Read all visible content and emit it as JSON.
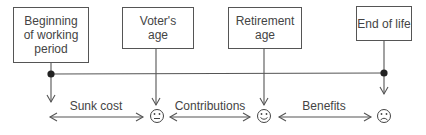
{
  "diagram": {
    "boxes": [
      {
        "id": "beginning",
        "label": "Beginning of working period",
        "lines": [
          "Beginning",
          "of working",
          "period"
        ]
      },
      {
        "id": "voter",
        "label": "Voter's age",
        "lines": [
          "Voter's",
          "age"
        ]
      },
      {
        "id": "retirement",
        "label": "Retirement age",
        "lines": [
          "Retirement",
          "age"
        ]
      },
      {
        "id": "end",
        "label": "End of life",
        "lines": [
          "End of life"
        ]
      }
    ],
    "segments": [
      {
        "label": "Sunk cost"
      },
      {
        "label": "Contributions"
      },
      {
        "label": "Benefits"
      }
    ],
    "faces": [
      {
        "id": "voter-face",
        "icon": "neutral-face-icon",
        "glyph": "😐"
      },
      {
        "id": "retirement-face",
        "icon": "smiling-face-icon",
        "glyph": "☺"
      },
      {
        "id": "end-face",
        "icon": "sad-face-icon",
        "glyph": "☹"
      }
    ],
    "colors": {
      "line": "#555555",
      "text": "#444444",
      "background": "#ffffff"
    }
  }
}
